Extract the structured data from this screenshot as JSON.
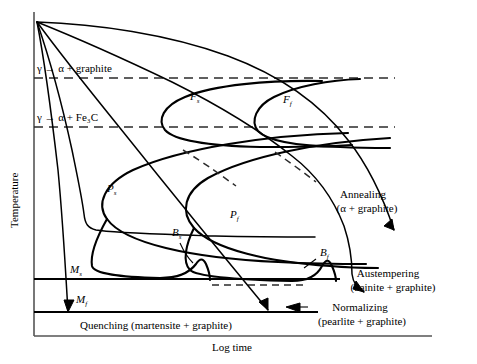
{
  "figure": {
    "type": "cct-diagram",
    "axes": {
      "x_label": "Log time",
      "y_label": "Temperature",
      "x_ticks": [],
      "y_ticks": [],
      "grid": false
    },
    "horizontal_lines": [
      {
        "id": "ae-graphite",
        "label": "γ → α + graphite",
        "style": "dashed",
        "y_frac": 0.215
      },
      {
        "id": "ae-fe3c",
        "label": "γ → α + Fe₃C",
        "style": "dashed",
        "y_frac": 0.357
      },
      {
        "id": "ms",
        "label": "M",
        "label_sub": "s",
        "style": "solid",
        "y_frac": 0.78
      },
      {
        "id": "mf",
        "label": "M",
        "label_sub": "f",
        "style": "solid",
        "y_frac": 0.877
      }
    ],
    "curve_labels": [
      {
        "id": "fs",
        "base": "F",
        "sub": "s",
        "x": 190,
        "y": 100
      },
      {
        "id": "ff",
        "base": "F",
        "sub": "f",
        "x": 283,
        "y": 103
      },
      {
        "id": "ps",
        "base": "P",
        "sub": "s",
        "x": 107,
        "y": 192
      },
      {
        "id": "pf",
        "base": "P",
        "sub": "f",
        "x": 230,
        "y": 218
      },
      {
        "id": "bs",
        "base": "B",
        "sub": "s",
        "x": 178,
        "y": 236
      },
      {
        "id": "bf",
        "base": "B",
        "sub": "f",
        "x": 320,
        "y": 256
      }
    ],
    "process_labels": [
      {
        "id": "annealing",
        "line1": "Annealing",
        "line2": "(α + graphite)",
        "x": 363,
        "y": 198
      },
      {
        "id": "austempering",
        "line1": "Austempering",
        "line2": "(bainite + graphite)",
        "x": 388,
        "y": 277
      },
      {
        "id": "normalizing",
        "line1": "Normalizing",
        "line2": "(pearlite + graphite)",
        "x": 360,
        "y": 313
      },
      {
        "id": "quenching",
        "line1": "Quenching (martensite + graphite)",
        "line2": "",
        "x": 83,
        "y": 325
      }
    ]
  }
}
